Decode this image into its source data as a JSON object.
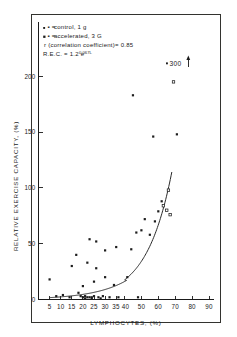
{
  "figure": {
    "frame_color": "#33332f",
    "ink_color": "#1a1a1a"
  },
  "legend": {
    "marker_control": "▪ =",
    "label_control": "control, 1 g",
    "marker_accelerated": "▪ =",
    "label_accelerated": "accelerated, 3 G",
    "correlation": "r (correlation coefficient)= 0.85",
    "equation_base": "R.E.C. = 1.2 e",
    "equation_exponent": "0.067L"
  },
  "annotation": {
    "offscale_marker": "▪",
    "offscale_value": "300",
    "offscale_arrow": "↑"
  },
  "chart_data": {
    "type": "scatter",
    "title": "",
    "xlabel": "LYMPHOCYTES, (%)",
    "ylabel": "RELATIVE EXERCISE CAPACITY, (%)",
    "xlim": [
      0,
      95
    ],
    "ylim": [
      0,
      230
    ],
    "grid": false,
    "legend_position": "top-left",
    "xticks": [
      5,
      10,
      15,
      20,
      25,
      30,
      35,
      40,
      50,
      60,
      70,
      80,
      90
    ],
    "xtick_labels": [
      "5",
      "10",
      "15",
      "20",
      "25",
      "30",
      "35",
      "40",
      "50",
      "60",
      "70",
      "80",
      "90"
    ],
    "yticks": [
      0,
      50,
      100,
      150,
      200
    ],
    "ytick_labels": [
      "0",
      "50",
      "100",
      "150",
      "200"
    ],
    "fit": {
      "name": "R.E.C. = 1.2 e^(0.067L)",
      "amplitude": 1.2,
      "rate": 0.067,
      "r": 0.85,
      "x_start": 5,
      "x_end": 68
    },
    "series": [
      {
        "name": "control, 1 g",
        "marker": "filled-square",
        "points": [
          [
            5,
            18
          ],
          [
            8,
            3
          ],
          [
            11,
            4
          ],
          [
            14,
            2
          ],
          [
            15,
            30
          ],
          [
            17,
            40
          ],
          [
            18,
            6
          ],
          [
            19,
            3
          ],
          [
            20,
            2
          ],
          [
            20,
            12
          ],
          [
            21,
            3
          ],
          [
            21,
            1
          ],
          [
            22,
            2
          ],
          [
            22,
            33
          ],
          [
            23,
            2
          ],
          [
            23,
            54
          ],
          [
            24,
            2
          ],
          [
            24,
            1
          ],
          [
            25,
            3
          ],
          [
            25,
            16
          ],
          [
            26,
            28
          ],
          [
            26,
            52
          ],
          [
            27,
            2
          ],
          [
            28,
            1
          ],
          [
            29,
            3
          ],
          [
            30,
            20
          ],
          [
            30,
            44
          ],
          [
            32,
            2
          ],
          [
            34,
            13
          ],
          [
            35,
            47
          ],
          [
            36,
            2
          ],
          [
            40,
            20
          ],
          [
            44,
            45
          ],
          [
            45,
            183
          ],
          [
            47,
            60
          ],
          [
            48,
            2
          ],
          [
            50,
            62
          ],
          [
            52,
            72
          ],
          [
            55,
            58
          ],
          [
            57,
            146
          ],
          [
            58,
            70
          ],
          [
            60,
            79
          ],
          [
            62,
            88
          ],
          [
            71,
            148
          ]
        ]
      },
      {
        "name": "accelerated, 3 G",
        "marker": "open-square",
        "points": [
          [
            63,
            84
          ],
          [
            65,
            80
          ],
          [
            66,
            98
          ],
          [
            67,
            76
          ],
          [
            69,
            195
          ]
        ]
      }
    ],
    "offscale_points": [
      {
        "label": "300",
        "y_value": 300,
        "note": "point plotted above axis range with up arrow"
      }
    ]
  }
}
